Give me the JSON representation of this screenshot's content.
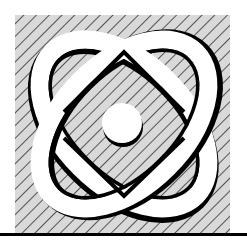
{
  "logo": {
    "name": "atom-emblem",
    "description": "Two crossing elliptical orbits with a central nucleus over a diagonally hatched square",
    "colors": {
      "background": "#ffffff",
      "hatch_fill": "#d9d9d9",
      "hatch_line": "#1a1a1a",
      "orbit_fill": "#ffffff",
      "orbit_shadow": "#000000",
      "nucleus_fill": "#ffffff",
      "baseline": "#000000"
    },
    "elements": {
      "hatched_square": "hatched-square",
      "orbit_a": "orbit-ellipse-diagonal-left",
      "orbit_b": "orbit-ellipse-diagonal-right",
      "nucleus": "nucleus-circle",
      "baseline": "baseline-rule"
    }
  }
}
